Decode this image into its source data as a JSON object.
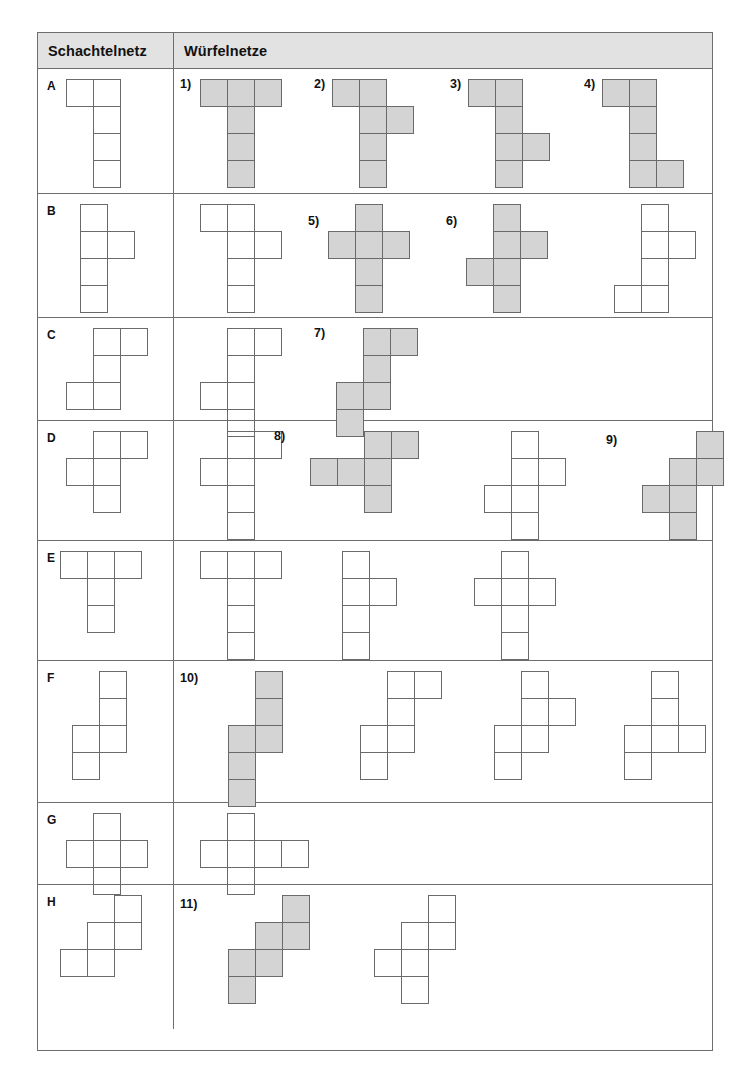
{
  "header": {
    "col1": "Schachtelnetz",
    "col2": "Würfelnetze"
  },
  "colors": {
    "shaded_fill": "#d4d4d4",
    "outline": "#6a6a6a",
    "header_bg": "#e2e2e2",
    "table_border": "#6e6e6e"
  },
  "cell_size": 27,
  "rows": [
    {
      "label": "A",
      "box_net": {
        "left": 28,
        "top": 10,
        "cells": [
          [
            0,
            0
          ],
          [
            1,
            0
          ],
          [
            1,
            1
          ],
          [
            1,
            2
          ],
          [
            1,
            3
          ]
        ]
      },
      "nets": [
        {
          "number": "1)",
          "num_x": 6,
          "num_y": 8,
          "left": 26,
          "top": 10,
          "shaded": true,
          "cells": [
            [
              0,
              0
            ],
            [
              1,
              0
            ],
            [
              2,
              0
            ],
            [
              1,
              1
            ],
            [
              1,
              2
            ],
            [
              1,
              3
            ]
          ]
        },
        {
          "number": "2)",
          "num_x": 140,
          "num_y": 8,
          "left": 158,
          "top": 10,
          "shaded": true,
          "cells": [
            [
              0,
              0
            ],
            [
              1,
              0
            ],
            [
              1,
              1
            ],
            [
              2,
              1
            ],
            [
              1,
              2
            ],
            [
              1,
              3
            ]
          ]
        },
        {
          "number": "3)",
          "num_x": 276,
          "num_y": 8,
          "left": 294,
          "top": 10,
          "shaded": true,
          "cells": [
            [
              0,
              0
            ],
            [
              1,
              0
            ],
            [
              1,
              1
            ],
            [
              1,
              2
            ],
            [
              2,
              2
            ],
            [
              1,
              3
            ]
          ]
        },
        {
          "number": "4)",
          "num_x": 410,
          "num_y": 8,
          "left": 428,
          "top": 10,
          "shaded": true,
          "cells": [
            [
              0,
              0
            ],
            [
              1,
              0
            ],
            [
              1,
              1
            ],
            [
              1,
              2
            ],
            [
              1,
              3
            ],
            [
              2,
              3
            ]
          ]
        }
      ]
    },
    {
      "label": "B",
      "box_net": {
        "left": 42,
        "top": 10,
        "cells": [
          [
            0,
            0
          ],
          [
            0,
            1
          ],
          [
            1,
            1
          ],
          [
            0,
            2
          ],
          [
            0,
            3
          ]
        ]
      },
      "nets": [
        {
          "number": "",
          "num_x": 0,
          "num_y": 0,
          "left": 26,
          "top": 10,
          "shaded": false,
          "cells": [
            [
              0,
              0
            ],
            [
              1,
              0
            ],
            [
              1,
              1
            ],
            [
              2,
              1
            ],
            [
              1,
              2
            ],
            [
              1,
              3
            ]
          ]
        },
        {
          "number": "5)",
          "num_x": 134,
          "num_y": 20,
          "left": 154,
          "top": 10,
          "shaded": true,
          "cells": [
            [
              1,
              0
            ],
            [
              0,
              1
            ],
            [
              1,
              1
            ],
            [
              2,
              1
            ],
            [
              1,
              2
            ],
            [
              1,
              3
            ]
          ]
        },
        {
          "number": "6)",
          "num_x": 272,
          "num_y": 20,
          "left": 292,
          "top": 10,
          "shaded": true,
          "cells": [
            [
              1,
              0
            ],
            [
              1,
              1
            ],
            [
              2,
              1
            ],
            [
              0,
              2
            ],
            [
              1,
              2
            ],
            [
              1,
              3
            ]
          ]
        },
        {
          "number": "",
          "num_x": 0,
          "num_y": 0,
          "left": 440,
          "top": 10,
          "shaded": false,
          "cells": [
            [
              1,
              0
            ],
            [
              1,
              1
            ],
            [
              2,
              1
            ],
            [
              1,
              2
            ],
            [
              0,
              3
            ],
            [
              1,
              3
            ]
          ]
        }
      ]
    },
    {
      "label": "C",
      "box_net": {
        "left": 28,
        "top": 10,
        "cells": [
          [
            1,
            0
          ],
          [
            2,
            0
          ],
          [
            1,
            1
          ],
          [
            0,
            2
          ],
          [
            1,
            2
          ]
        ]
      },
      "nets": [
        {
          "number": "",
          "num_x": 0,
          "num_y": 0,
          "left": 26,
          "top": 10,
          "shaded": false,
          "cells": [
            [
              1,
              0
            ],
            [
              2,
              0
            ],
            [
              1,
              1
            ],
            [
              0,
              2
            ],
            [
              1,
              2
            ],
            [
              1,
              3
            ]
          ]
        },
        {
          "number": "7)",
          "num_x": 140,
          "num_y": 8,
          "left": 162,
          "top": 10,
          "shaded": true,
          "cells": [
            [
              1,
              0
            ],
            [
              2,
              0
            ],
            [
              1,
              1
            ],
            [
              0,
              2
            ],
            [
              1,
              2
            ],
            [
              0,
              3
            ]
          ]
        }
      ]
    },
    {
      "label": "D",
      "box_net": {
        "left": 28,
        "top": 10,
        "cells": [
          [
            1,
            0
          ],
          [
            2,
            0
          ],
          [
            0,
            1
          ],
          [
            1,
            1
          ],
          [
            1,
            2
          ]
        ]
      },
      "nets": [
        {
          "number": "",
          "num_x": 0,
          "num_y": 0,
          "left": 26,
          "top": 10,
          "shaded": false,
          "cells": [
            [
              1,
              0
            ],
            [
              2,
              0
            ],
            [
              0,
              1
            ],
            [
              1,
              1
            ],
            [
              1,
              2
            ],
            [
              1,
              3
            ]
          ]
        },
        {
          "number": "8)",
          "num_x": 100,
          "num_y": 8,
          "left": 136,
          "top": 10,
          "shaded": true,
          "cells": [
            [
              2,
              0
            ],
            [
              3,
              0
            ],
            [
              0,
              1
            ],
            [
              1,
              1
            ],
            [
              2,
              1
            ],
            [
              2,
              2
            ]
          ]
        },
        {
          "number": "",
          "num_x": 0,
          "num_y": 0,
          "left": 310,
          "top": 10,
          "shaded": false,
          "cells": [
            [
              1,
              0
            ],
            [
              1,
              1
            ],
            [
              2,
              1
            ],
            [
              0,
              2
            ],
            [
              1,
              2
            ],
            [
              1,
              3
            ]
          ]
        },
        {
          "number": "9)",
          "num_x": 432,
          "num_y": 12,
          "left": 468,
          "top": 10,
          "shaded": true,
          "cells": [
            [
              2,
              0
            ],
            [
              1,
              1
            ],
            [
              2,
              1
            ],
            [
              0,
              2
            ],
            [
              1,
              2
            ],
            [
              1,
              3
            ]
          ]
        }
      ]
    },
    {
      "label": "E",
      "box_net": {
        "left": 22,
        "top": 10,
        "cells": [
          [
            0,
            0
          ],
          [
            1,
            0
          ],
          [
            2,
            0
          ],
          [
            1,
            1
          ],
          [
            1,
            2
          ]
        ]
      },
      "nets": [
        {
          "number": "",
          "num_x": 0,
          "num_y": 0,
          "left": 26,
          "top": 10,
          "shaded": false,
          "cells": [
            [
              0,
              0
            ],
            [
              1,
              0
            ],
            [
              2,
              0
            ],
            [
              1,
              1
            ],
            [
              1,
              2
            ],
            [
              1,
              3
            ]
          ]
        },
        {
          "number": "",
          "num_x": 0,
          "num_y": 0,
          "left": 168,
          "top": 10,
          "shaded": false,
          "cells": [
            [
              0,
              0
            ],
            [
              0,
              1
            ],
            [
              1,
              1
            ],
            [
              0,
              2
            ],
            [
              0,
              3
            ]
          ]
        },
        {
          "number": "",
          "num_x": 0,
          "num_y": 0,
          "left": 300,
          "top": 10,
          "shaded": false,
          "cells": [
            [
              1,
              0
            ],
            [
              0,
              1
            ],
            [
              1,
              1
            ],
            [
              2,
              1
            ],
            [
              1,
              2
            ],
            [
              1,
              3
            ]
          ]
        }
      ]
    },
    {
      "label": "F",
      "box_net": {
        "left": 34,
        "top": 10,
        "cells": [
          [
            1,
            0
          ],
          [
            1,
            1
          ],
          [
            0,
            2
          ],
          [
            1,
            2
          ],
          [
            0,
            3
          ]
        ]
      },
      "nets": [
        {
          "number": "10)",
          "num_x": 6,
          "num_y": 10,
          "left": 54,
          "top": 10,
          "shaded": true,
          "cells": [
            [
              1,
              0
            ],
            [
              1,
              1
            ],
            [
              0,
              2
            ],
            [
              1,
              2
            ],
            [
              0,
              3
            ],
            [
              0,
              4
            ]
          ]
        },
        {
          "number": "",
          "num_x": 0,
          "num_y": 0,
          "left": 186,
          "top": 10,
          "shaded": false,
          "cells": [
            [
              1,
              0
            ],
            [
              2,
              0
            ],
            [
              1,
              1
            ],
            [
              0,
              2
            ],
            [
              1,
              2
            ],
            [
              0,
              3
            ]
          ]
        },
        {
          "number": "",
          "num_x": 0,
          "num_y": 0,
          "left": 320,
          "top": 10,
          "shaded": false,
          "cells": [
            [
              1,
              0
            ],
            [
              1,
              1
            ],
            [
              2,
              1
            ],
            [
              0,
              2
            ],
            [
              1,
              2
            ],
            [
              0,
              3
            ]
          ]
        },
        {
          "number": "",
          "num_x": 0,
          "num_y": 0,
          "left": 450,
          "top": 10,
          "shaded": false,
          "cells": [
            [
              1,
              0
            ],
            [
              1,
              1
            ],
            [
              0,
              2
            ],
            [
              1,
              2
            ],
            [
              2,
              2
            ],
            [
              0,
              3
            ]
          ]
        }
      ]
    },
    {
      "label": "G",
      "box_net": {
        "left": 28,
        "top": 10,
        "cells": [
          [
            1,
            0
          ],
          [
            0,
            1
          ],
          [
            1,
            1
          ],
          [
            2,
            1
          ],
          [
            1,
            2
          ]
        ]
      },
      "nets": [
        {
          "number": "",
          "num_x": 0,
          "num_y": 0,
          "left": 26,
          "top": 10,
          "shaded": false,
          "cells": [
            [
              1,
              0
            ],
            [
              0,
              1
            ],
            [
              1,
              1
            ],
            [
              2,
              1
            ],
            [
              3,
              1
            ],
            [
              1,
              2
            ]
          ]
        }
      ]
    },
    {
      "label": "H",
      "box_net": {
        "left": 22,
        "top": 10,
        "cells": [
          [
            2,
            0
          ],
          [
            1,
            1
          ],
          [
            2,
            1
          ],
          [
            0,
            2
          ],
          [
            1,
            2
          ]
        ]
      },
      "nets": [
        {
          "number": "11)",
          "num_x": 6,
          "num_y": 12,
          "left": 54,
          "top": 10,
          "shaded": true,
          "cells": [
            [
              2,
              0
            ],
            [
              1,
              1
            ],
            [
              2,
              1
            ],
            [
              0,
              2
            ],
            [
              1,
              2
            ],
            [
              0,
              3
            ]
          ]
        },
        {
          "number": "",
          "num_x": 0,
          "num_y": 0,
          "left": 200,
          "top": 10,
          "shaded": false,
          "cells": [
            [
              2,
              0
            ],
            [
              1,
              1
            ],
            [
              2,
              1
            ],
            [
              0,
              2
            ],
            [
              1,
              2
            ],
            [
              1,
              3
            ]
          ]
        }
      ]
    }
  ],
  "row_heights": [
    125,
    124,
    103,
    120,
    120,
    142,
    82,
    144
  ]
}
